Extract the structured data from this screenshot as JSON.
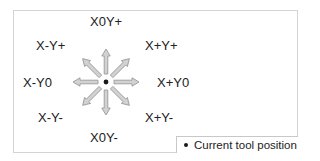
{
  "diagram": {
    "type": "jog-direction-diagram",
    "center": {
      "x": 106,
      "y": 82,
      "meaning": "current tool position"
    },
    "colors": {
      "arrow_fill": "#d2d2d2",
      "arrow_stroke": "#9a9a9a",
      "dot": "#1a1a1a",
      "frame_border": "#d4d4d4",
      "text": "#222222"
    },
    "directions": [
      {
        "id": "x0-yplus",
        "label": "X0Y+",
        "angle_deg": -90
      },
      {
        "id": "xplus-yplus",
        "label": "X+Y+",
        "angle_deg": -45
      },
      {
        "id": "xplus-y0",
        "label": "X+Y0",
        "angle_deg": 0
      },
      {
        "id": "xplus-yminus",
        "label": "X+Y-",
        "angle_deg": 45
      },
      {
        "id": "x0-yminus",
        "label": "X0Y-",
        "angle_deg": 90
      },
      {
        "id": "xminus-yminus",
        "label": "X-Y-",
        "angle_deg": 135
      },
      {
        "id": "xminus-y0",
        "label": "X-Y0",
        "angle_deg": 180
      },
      {
        "id": "xminus-yplus",
        "label": "X-Y+",
        "angle_deg": -135
      }
    ]
  },
  "labels": {
    "x0_yplus": "X0Y+",
    "xminus_yplus": "X-Y+",
    "xplus_yplus": "X+Y+",
    "xminus_y0": "X-Y0",
    "xplus_y0": "X+Y0",
    "xminus_yminus": "X-Y-",
    "xplus_yminus": "X+Y-",
    "x0_yminus": "X0Y-"
  },
  "legend": {
    "symbol": "dot",
    "text": "Current tool position"
  }
}
